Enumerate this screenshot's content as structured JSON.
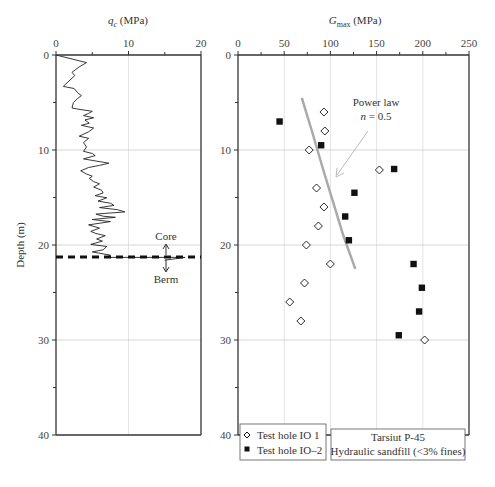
{
  "chart_data": [
    {
      "type": "line",
      "panel": "left",
      "title": "",
      "xlabel": "q_c (MPa)",
      "xlabel_main": "q",
      "xlabel_sub": "c",
      "xlabel_unit": " (MPa)",
      "ylabel": "Depth (m)",
      "xlim": [
        0,
        20
      ],
      "ylim": [
        0,
        40
      ],
      "x_ticks": [
        "0",
        "10",
        "20"
      ],
      "y_ticks": [
        "0",
        "10",
        "20",
        "30",
        "40"
      ],
      "grid": true,
      "series": [
        {
          "name": "CPT qc profile",
          "points": [
            [
              0,
              0
            ],
            [
              4.2,
              1.4
            ],
            [
              3.2,
              2.2
            ],
            [
              2.2,
              3.2
            ],
            [
              2.6,
              3.8
            ],
            [
              1.8,
              4.8
            ],
            [
              1.0,
              5.8
            ],
            [
              2.5,
              6.2
            ],
            [
              3.0,
              7.0
            ],
            [
              3.5,
              7.5
            ],
            [
              3.0,
              8.0
            ],
            [
              2.4,
              8.8
            ],
            [
              2.2,
              9.8
            ],
            [
              3.0,
              10.0
            ],
            [
              5.0,
              10.4
            ],
            [
              4.5,
              10.8
            ],
            [
              3.8,
              11.2
            ],
            [
              5.2,
              11.6
            ],
            [
              4.0,
              12.0
            ],
            [
              4.6,
              12.6
            ],
            [
              3.5,
              13.0
            ],
            [
              5.2,
              13.5
            ],
            [
              4.5,
              14.2
            ],
            [
              3.2,
              15.0
            ],
            [
              4.5,
              15.4
            ],
            [
              3.8,
              16.2
            ],
            [
              4.2,
              17.0
            ],
            [
              3.8,
              17.8
            ],
            [
              5.0,
              18.2
            ],
            [
              5.4,
              18.6
            ],
            [
              3.8,
              19.2
            ],
            [
              5.5,
              19.6
            ],
            [
              7.3,
              20.0
            ],
            [
              6.0,
              20.4
            ],
            [
              4.5,
              20.8
            ],
            [
              3.4,
              21.4
            ],
            [
              4.2,
              22.0
            ],
            [
              5.0,
              22.4
            ],
            [
              4.6,
              22.8
            ],
            [
              5.2,
              23.4
            ],
            [
              6.0,
              23.8
            ],
            [
              5.2,
              24.4
            ],
            [
              6.3,
              25.0
            ],
            [
              6.5,
              25.5
            ],
            [
              5.4,
              26.0
            ],
            [
              7.0,
              26.4
            ],
            [
              5.8,
              27.0
            ],
            [
              7.5,
              27.4
            ],
            [
              8.0,
              27.8
            ],
            [
              6.0,
              28.2
            ],
            [
              8.5,
              28.6
            ],
            [
              9.5,
              29.0
            ],
            [
              5.5,
              29.4
            ],
            [
              6.5,
              29.8
            ],
            [
              8.2,
              30.0
            ],
            [
              5.0,
              30.4
            ],
            [
              7.5,
              30.8
            ],
            [
              4.5,
              31.4
            ],
            [
              6.0,
              32.0
            ],
            [
              4.8,
              32.6
            ],
            [
              5.5,
              33.0
            ],
            [
              6.8,
              33.4
            ],
            [
              5.6,
              34.0
            ],
            [
              6.4,
              34.4
            ],
            [
              4.8,
              35.0
            ],
            [
              7.0,
              35.4
            ],
            [
              6.5,
              36.0
            ],
            [
              5.0,
              36.4
            ],
            [
              7.5,
              37.0
            ],
            [
              6.8,
              37.4
            ]
          ],
          "note": "approximate digitized trace; profile ends at ~21.3 m"
        }
      ],
      "annotations": [
        {
          "text": "Core",
          "arrow": "up",
          "depth": 21.3
        },
        {
          "text": "Berm",
          "arrow": "down",
          "depth": 21.3
        },
        {
          "type": "dashed-line",
          "depth": 21.3,
          "label": "core/berm boundary"
        }
      ]
    },
    {
      "type": "scatter",
      "panel": "right",
      "title": "",
      "xlabel": "G_max (MPa)",
      "xlabel_main": "G",
      "xlabel_sub": "max",
      "xlabel_unit": " (MPa)",
      "ylabel": "Depth (m)",
      "xlim": [
        0,
        250
      ],
      "ylim": [
        0,
        40
      ],
      "x_ticks": [
        "0",
        "50",
        "100",
        "150",
        "200",
        "250"
      ],
      "y_ticks": [
        "0",
        "10",
        "20",
        "30",
        "40"
      ],
      "grid": true,
      "series": [
        {
          "name": "Test hole IO 1",
          "marker": "open-diamond",
          "points": [
            [
              93,
              6.0
            ],
            [
              94,
              8.0
            ],
            [
              77,
              10.0
            ],
            [
              153,
              12.1
            ],
            [
              85,
              14.0
            ],
            [
              93,
              16.0
            ],
            [
              87,
              18.0
            ],
            [
              74,
              20.0
            ],
            [
              100,
              22.0
            ],
            [
              72,
              24.0
            ],
            [
              56,
              26.0
            ],
            [
              68,
              28.0
            ],
            [
              202,
              30.0
            ]
          ]
        },
        {
          "name": "Test hole IO–2",
          "marker": "filled-square",
          "points": [
            [
              45,
              7.0
            ],
            [
              90,
              9.5
            ],
            [
              169,
              12.0
            ],
            [
              126,
              14.5
            ],
            [
              116,
              17.0
            ],
            [
              120,
              19.5
            ],
            [
              190,
              22.0
            ],
            [
              199,
              24.5
            ],
            [
              196,
              27.0
            ],
            [
              174,
              29.5
            ]
          ]
        },
        {
          "name": "Power law n = 0.5",
          "type": "line",
          "color": "#aaaaaa",
          "points": [
            [
              69,
              4.5
            ],
            [
              80,
              8.0
            ],
            [
              92,
              12.0
            ],
            [
              103,
              15.5
            ],
            [
              114,
              19.0
            ],
            [
              127,
              22.5
            ]
          ]
        }
      ],
      "annotations": [
        {
          "text_line1": "Power law",
          "text_line2": "n = 0.5",
          "arrow_to": [
            105,
            12.0
          ]
        }
      ],
      "legend": {
        "position": "lower-left",
        "entries": [
          "Test hole IO 1",
          "Test hole IO–2"
        ]
      },
      "info_box": {
        "line1": "Tarsiut P-45",
        "line2": "Hydraulic sandfill (<3% fines)"
      }
    }
  ],
  "labels": {
    "left_xlabel_main": "q",
    "left_xlabel_sub": "c",
    "left_xlabel_unit": " (MPa)",
    "right_xlabel_main": "G",
    "right_xlabel_sub": "max",
    "right_xlabel_unit": " (MPa)",
    "ylabel": "Depth (m)",
    "core": "Core",
    "berm": "Berm",
    "power_law_1": "Power law",
    "power_law_n": "n",
    "power_law_eq": " = 0.5",
    "legend_1": "Test hole IO 1",
    "legend_2": "Test hole IO–2",
    "info_1": "Tarsiut P-45",
    "info_2": "Hydraulic sandfill (<3% fines)"
  },
  "colors": {
    "axis": "#333333",
    "grid": "#cccccc",
    "power_law": "#aaaaaa",
    "arrow": "#bbbbbb",
    "marker": "#111111"
  }
}
